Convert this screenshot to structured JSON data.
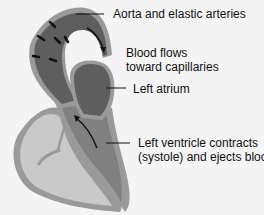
{
  "labels": {
    "aorta": "Aorta and elastic arteries",
    "blood_flow": [
      "Blood flows",
      "toward capillaries"
    ],
    "left_atrium": "Left atrium",
    "left_ventricle": [
      "Left ventricle contracts",
      "(systole) and ejects blood"
    ]
  },
  "colors": {
    "background": "#f4f4f4",
    "wall": "#9a9a9a",
    "dark_chamber": "#5e5e5e",
    "mid_chamber": "#808080",
    "light_chamber": "#c9c9c9",
    "arrow": "#111111"
  }
}
